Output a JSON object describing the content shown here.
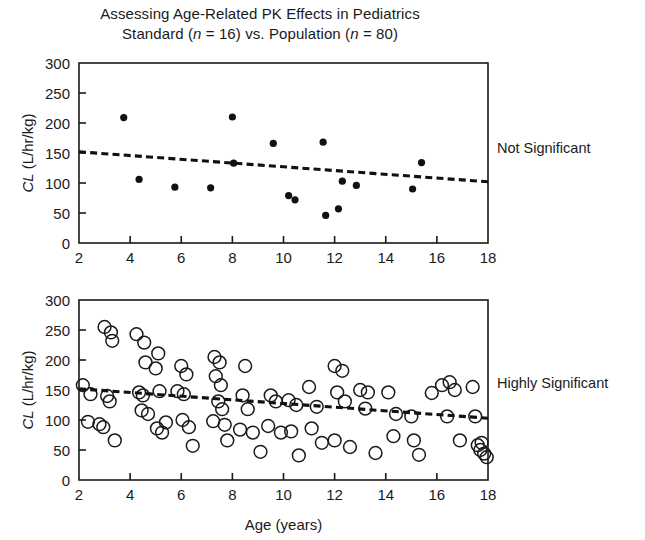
{
  "figure": {
    "title_line1": "Assessing Age-Related PK Effects in Pediatrics",
    "title_line2_pre": "Standard (",
    "title_line2_n1": "n",
    "title_line2_mid": " = 16) vs. Population (",
    "title_line2_n2": "n",
    "title_line2_post": " = 80)",
    "title_line2_plain": "Standard (n = 16) vs. Population (n = 80)",
    "annotation_top": "Not Significant",
    "annotation_bottom": "Highly Significant",
    "ink_color": "#1a1a1a",
    "background_color": "#ffffff"
  },
  "chart_data": [
    {
      "type": "scatter",
      "id": "standard-panel",
      "title": "Standard (n = 16)",
      "annotation": "Not Significant",
      "xlabel": "",
      "ylabel": "CL (L/hr/kg)",
      "ylabel_italic_part": "CL",
      "ylabel_rest": " (L/hr/kg)",
      "xlim": [
        2,
        18
      ],
      "ylim": [
        0,
        300
      ],
      "xticks": [
        2,
        4,
        6,
        8,
        10,
        12,
        14,
        16,
        18
      ],
      "yticks": [
        0,
        50,
        100,
        150,
        200,
        250,
        300
      ],
      "grid": false,
      "legend": "none",
      "marker": "filled-circle",
      "marker_radius_px": 3.6,
      "n": 16,
      "points": [
        {
          "x": 3.75,
          "y": 209
        },
        {
          "x": 4.35,
          "y": 106
        },
        {
          "x": 5.75,
          "y": 93
        },
        {
          "x": 7.15,
          "y": 92
        },
        {
          "x": 8.0,
          "y": 210
        },
        {
          "x": 9.6,
          "y": 166
        },
        {
          "x": 10.2,
          "y": 79
        },
        {
          "x": 10.45,
          "y": 72
        },
        {
          "x": 11.55,
          "y": 168
        },
        {
          "x": 11.65,
          "y": 46
        },
        {
          "x": 12.15,
          "y": 57
        },
        {
          "x": 12.3,
          "y": 103
        },
        {
          "x": 12.85,
          "y": 96
        },
        {
          "x": 15.05,
          "y": 90
        },
        {
          "x": 15.4,
          "y": 134
        },
        {
          "x": 8.05,
          "y": 133
        }
      ],
      "trendline": {
        "x0": 2,
        "y0": 152,
        "x1": 18,
        "y1": 102,
        "style": "dashed"
      }
    },
    {
      "type": "scatter",
      "id": "population-panel",
      "title": "Population (n = 80)",
      "annotation": "Highly Significant",
      "xlabel": "Age (years)",
      "ylabel": "CL (L/hr/kg)",
      "ylabel_italic_part": "CL",
      "ylabel_rest": " (L/hr/kg)",
      "xlim": [
        2,
        18
      ],
      "ylim": [
        0,
        300
      ],
      "xticks": [
        2,
        4,
        6,
        8,
        10,
        12,
        14,
        16,
        18
      ],
      "yticks": [
        0,
        50,
        100,
        150,
        200,
        250,
        300
      ],
      "grid": false,
      "legend": "none",
      "marker": "open-circle",
      "marker_radius_px": 6.4,
      "n": 80,
      "points": [
        {
          "x": 2.15,
          "y": 158
        },
        {
          "x": 2.35,
          "y": 97
        },
        {
          "x": 2.45,
          "y": 143
        },
        {
          "x": 3.0,
          "y": 255
        },
        {
          "x": 3.25,
          "y": 246
        },
        {
          "x": 3.3,
          "y": 232
        },
        {
          "x": 3.1,
          "y": 140
        },
        {
          "x": 3.2,
          "y": 131
        },
        {
          "x": 2.8,
          "y": 93
        },
        {
          "x": 2.95,
          "y": 88
        },
        {
          "x": 3.4,
          "y": 66
        },
        {
          "x": 4.25,
          "y": 243
        },
        {
          "x": 4.55,
          "y": 229
        },
        {
          "x": 4.6,
          "y": 196
        },
        {
          "x": 4.35,
          "y": 146
        },
        {
          "x": 4.5,
          "y": 141
        },
        {
          "x": 4.45,
          "y": 116
        },
        {
          "x": 4.7,
          "y": 110
        },
        {
          "x": 5.1,
          "y": 211
        },
        {
          "x": 5.0,
          "y": 186
        },
        {
          "x": 5.15,
          "y": 148
        },
        {
          "x": 5.05,
          "y": 86
        },
        {
          "x": 5.25,
          "y": 79
        },
        {
          "x": 5.4,
          "y": 96
        },
        {
          "x": 6.0,
          "y": 190
        },
        {
          "x": 6.2,
          "y": 176
        },
        {
          "x": 5.85,
          "y": 148
        },
        {
          "x": 6.1,
          "y": 143
        },
        {
          "x": 6.05,
          "y": 100
        },
        {
          "x": 6.3,
          "y": 88
        },
        {
          "x": 6.45,
          "y": 57
        },
        {
          "x": 7.3,
          "y": 205
        },
        {
          "x": 7.5,
          "y": 196
        },
        {
          "x": 7.35,
          "y": 173
        },
        {
          "x": 7.55,
          "y": 158
        },
        {
          "x": 7.45,
          "y": 131
        },
        {
          "x": 7.6,
          "y": 118
        },
        {
          "x": 7.25,
          "y": 98
        },
        {
          "x": 7.7,
          "y": 92
        },
        {
          "x": 7.8,
          "y": 66
        },
        {
          "x": 8.5,
          "y": 190
        },
        {
          "x": 8.4,
          "y": 141
        },
        {
          "x": 8.6,
          "y": 118
        },
        {
          "x": 8.3,
          "y": 84
        },
        {
          "x": 8.8,
          "y": 79
        },
        {
          "x": 9.1,
          "y": 47
        },
        {
          "x": 9.5,
          "y": 141
        },
        {
          "x": 9.7,
          "y": 131
        },
        {
          "x": 9.4,
          "y": 90
        },
        {
          "x": 9.9,
          "y": 79
        },
        {
          "x": 10.2,
          "y": 133
        },
        {
          "x": 10.5,
          "y": 125
        },
        {
          "x": 10.3,
          "y": 81
        },
        {
          "x": 10.6,
          "y": 41
        },
        {
          "x": 11.0,
          "y": 155
        },
        {
          "x": 11.3,
          "y": 122
        },
        {
          "x": 11.1,
          "y": 86
        },
        {
          "x": 11.5,
          "y": 62
        },
        {
          "x": 12.0,
          "y": 190
        },
        {
          "x": 12.3,
          "y": 182
        },
        {
          "x": 12.1,
          "y": 146
        },
        {
          "x": 12.4,
          "y": 131
        },
        {
          "x": 12.0,
          "y": 66
        },
        {
          "x": 12.6,
          "y": 55
        },
        {
          "x": 13.0,
          "y": 150
        },
        {
          "x": 13.3,
          "y": 146
        },
        {
          "x": 13.2,
          "y": 119
        },
        {
          "x": 13.6,
          "y": 45
        },
        {
          "x": 14.1,
          "y": 146
        },
        {
          "x": 14.4,
          "y": 110
        },
        {
          "x": 14.3,
          "y": 73
        },
        {
          "x": 15.0,
          "y": 106
        },
        {
          "x": 15.1,
          "y": 66
        },
        {
          "x": 15.3,
          "y": 42
        },
        {
          "x": 15.8,
          "y": 145
        },
        {
          "x": 16.2,
          "y": 158
        },
        {
          "x": 16.5,
          "y": 163
        },
        {
          "x": 16.7,
          "y": 150
        },
        {
          "x": 16.4,
          "y": 106
        },
        {
          "x": 16.9,
          "y": 66
        },
        {
          "x": 17.4,
          "y": 155
        },
        {
          "x": 17.5,
          "y": 106
        },
        {
          "x": 17.6,
          "y": 58
        },
        {
          "x": 17.7,
          "y": 50
        },
        {
          "x": 17.85,
          "y": 44
        },
        {
          "x": 17.95,
          "y": 38
        },
        {
          "x": 17.75,
          "y": 62
        }
      ],
      "trendline": {
        "x0": 2,
        "y0": 152,
        "x1": 18,
        "y1": 103,
        "style": "dashed"
      }
    }
  ]
}
